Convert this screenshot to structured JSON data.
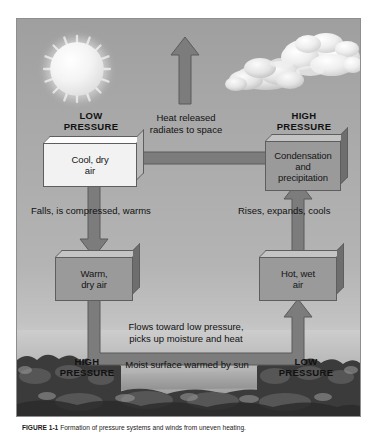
{
  "figure": {
    "colors": {
      "sky": "#a8a8a8",
      "box_light": "#f2f2f2",
      "box_gray": "#9a9a9a",
      "arrow": "#7c7c7c",
      "text": "#111111",
      "frame": "#8e8e8e"
    },
    "scene": {
      "sun": "sun-icon",
      "clouds": "cloud-icon",
      "ground": "landscape-terrain"
    },
    "pressure_labels": [
      {
        "id": "low-top-left",
        "line1": "LOW",
        "line2": "PRESSURE"
      },
      {
        "id": "high-top-right",
        "line1": "HIGH",
        "line2": "PRESSURE"
      },
      {
        "id": "high-bottom-left",
        "line1": "HIGH",
        "line2": "PRESSURE"
      },
      {
        "id": "low-bottom-right",
        "line1": "LOW",
        "line2": "PRESSURE"
      }
    ],
    "boxes": [
      {
        "id": "cool-dry-air",
        "line1": "Cool, dry",
        "line2": "air",
        "line3": "",
        "style": "light"
      },
      {
        "id": "condensation-and-precipitation",
        "line1": "Condensation",
        "line2": "and",
        "line3": "precipitation",
        "style": "gray"
      },
      {
        "id": "warm-dry-air",
        "line1": "Warm,",
        "line2": "dry air",
        "line3": "",
        "style": "gray"
      },
      {
        "id": "hot-wet-air",
        "line1": "Hot, wet",
        "line2": "air",
        "line3": "",
        "style": "gray"
      }
    ],
    "flow_labels": [
      {
        "id": "heat-released",
        "line1": "Heat released",
        "line2": "radiates to space"
      },
      {
        "id": "falls-compressed",
        "line1": "Falls, is compressed, warms",
        "line2": ""
      },
      {
        "id": "rises-expands",
        "line1": "Rises, expands, cools",
        "line2": ""
      },
      {
        "id": "flows-toward-low",
        "line1": "Flows toward low pressure,",
        "line2": "picks up moisture and heat"
      },
      {
        "id": "moist-surface",
        "line1": "Moist surface warmed by sun",
        "line2": ""
      }
    ],
    "arrows": [
      {
        "id": "arrow-to-space",
        "direction": "up"
      },
      {
        "id": "arrow-condensation-to-cool",
        "direction": "left"
      },
      {
        "id": "arrow-cool-to-warm",
        "direction": "down"
      },
      {
        "id": "arrow-hot-to-condensation",
        "direction": "up"
      },
      {
        "id": "arrow-warm-to-hot",
        "direction": "right"
      }
    ]
  },
  "caption": {
    "label": "FIGURE 1-1",
    "text": "Formation of pressure systems and winds from uneven heating."
  }
}
